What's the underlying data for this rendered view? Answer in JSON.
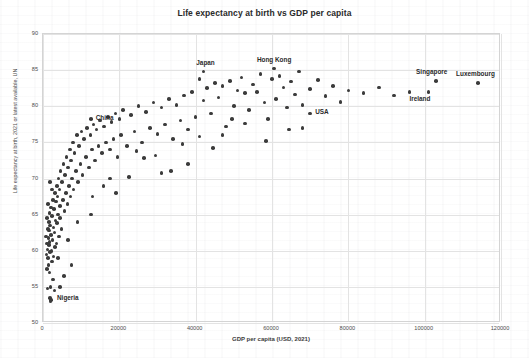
{
  "chart_data": {
    "type": "scatter",
    "title": "Life expectancy at birth vs GDP per capita",
    "xlabel": "GDP per capita  (USD, 2021)",
    "ylabel": "Life expectancy at birth, 2021 or latest available, UN",
    "xlim": [
      0,
      120000
    ],
    "ylim": [
      50,
      90
    ],
    "xticks": [
      "0",
      "20000",
      "40000",
      "60000",
      "80000",
      "100000",
      "120000"
    ],
    "xtick_values": [
      0,
      20000,
      40000,
      60000,
      80000,
      100000,
      120000
    ],
    "yticks": [
      "50",
      "55",
      "60",
      "65",
      "70",
      "75",
      "80",
      "85",
      "90"
    ],
    "ytick_values": [
      50,
      55,
      60,
      65,
      70,
      75,
      80,
      85,
      90
    ],
    "grid": true,
    "legend": "none",
    "marker_color": "#3b3b3b",
    "marker_size": 3.6,
    "points": [
      [
        800,
        62.0
      ],
      [
        900,
        59.5
      ],
      [
        1000,
        64.5
      ],
      [
        1000,
        61.0
      ],
      [
        1100,
        57.5
      ],
      [
        1150,
        60.2
      ],
      [
        1200,
        54.8
      ],
      [
        1250,
        63.0
      ],
      [
        1300,
        59.0
      ],
      [
        1350,
        66.5
      ],
      [
        1400,
        61.8
      ],
      [
        1450,
        58.0
      ],
      [
        1500,
        64.0
      ],
      [
        1550,
        60.8
      ],
      [
        1600,
        62.8
      ],
      [
        1650,
        57.0
      ],
      [
        1700,
        65.2
      ],
      [
        1750,
        61.2
      ],
      [
        1800,
        59.8
      ],
      [
        1850,
        63.5
      ],
      [
        1900,
        53.5
      ],
      [
        1950,
        55.0
      ],
      [
        2000,
        53.0
      ],
      [
        2050,
        62.2
      ],
      [
        2100,
        66.0
      ],
      [
        2200,
        60.0
      ],
      [
        2300,
        64.8
      ],
      [
        2400,
        58.5
      ],
      [
        2500,
        61.5
      ],
      [
        2600,
        67.0
      ],
      [
        2700,
        63.2
      ],
      [
        2800,
        59.2
      ],
      [
        2900,
        65.8
      ],
      [
        3000,
        62.5
      ],
      [
        3100,
        68.0
      ],
      [
        3200,
        60.5
      ],
      [
        3300,
        64.2
      ],
      [
        3400,
        66.8
      ],
      [
        3500,
        61.0
      ],
      [
        3600,
        69.0
      ],
      [
        3700,
        63.8
      ],
      [
        3800,
        67.5
      ],
      [
        3900,
        59.0
      ],
      [
        4000,
        65.0
      ],
      [
        4100,
        70.0
      ],
      [
        4200,
        62.0
      ],
      [
        4300,
        68.5
      ],
      [
        4400,
        64.5
      ],
      [
        4500,
        66.2
      ],
      [
        4600,
        71.0
      ],
      [
        4800,
        63.0
      ],
      [
        5000,
        69.5
      ],
      [
        5200,
        67.0
      ],
      [
        5400,
        72.0
      ],
      [
        5600,
        65.5
      ],
      [
        5800,
        70.5
      ],
      [
        6000,
        68.0
      ],
      [
        6200,
        73.0
      ],
      [
        6400,
        66.5
      ],
      [
        6600,
        71.5
      ],
      [
        6800,
        69.0
      ],
      [
        7000,
        74.0
      ],
      [
        7200,
        67.5
      ],
      [
        7400,
        72.5
      ],
      [
        7600,
        70.0
      ],
      [
        7800,
        75.0
      ],
      [
        8000,
        68.5
      ],
      [
        8300,
        73.5
      ],
      [
        8600,
        71.0
      ],
      [
        8900,
        76.0
      ],
      [
        9200,
        69.5
      ],
      [
        9500,
        74.5
      ],
      [
        9800,
        72.0
      ],
      [
        10100,
        76.5
      ],
      [
        10400,
        70.5
      ],
      [
        10800,
        75.5
      ],
      [
        11200,
        73.0
      ],
      [
        11600,
        77.0
      ],
      [
        12000,
        71.5
      ],
      [
        12400,
        76.0
      ],
      [
        12800,
        74.0
      ],
      [
        13200,
        77.5
      ],
      [
        13600,
        72.5
      ],
      [
        14000,
        76.8
      ],
      [
        14500,
        74.5
      ],
      [
        15000,
        78.0
      ],
      [
        15500,
        73.5
      ],
      [
        16000,
        77.2
      ],
      [
        16500,
        75.0
      ],
      [
        17000,
        78.5
      ],
      [
        17500,
        74.0
      ],
      [
        18000,
        77.8
      ],
      [
        18500,
        75.5
      ],
      [
        19000,
        79.0
      ],
      [
        19500,
        73.0
      ],
      [
        20000,
        78.2
      ],
      [
        20500,
        76.0
      ],
      [
        21000,
        79.5
      ],
      [
        22000,
        74.5
      ],
      [
        23000,
        78.8
      ],
      [
        24000,
        76.5
      ],
      [
        25000,
        80.0
      ],
      [
        26000,
        75.0
      ],
      [
        27000,
        79.2
      ],
      [
        28000,
        77.0
      ],
      [
        29000,
        80.5
      ],
      [
        30000,
        76.2
      ],
      [
        31000,
        79.8
      ],
      [
        32000,
        77.5
      ],
      [
        33000,
        81.0
      ],
      [
        34000,
        75.5
      ],
      [
        35000,
        80.2
      ],
      [
        36000,
        78.0
      ],
      [
        37000,
        81.5
      ],
      [
        38000,
        76.8
      ],
      [
        39000,
        82.0
      ],
      [
        40000,
        78.5
      ],
      [
        41000,
        83.8
      ],
      [
        42000,
        80.8
      ],
      [
        43000,
        82.5
      ],
      [
        44000,
        79.0
      ],
      [
        45000,
        83.2
      ],
      [
        46000,
        81.2
      ],
      [
        47000,
        82.8
      ],
      [
        48000,
        77.2
      ],
      [
        49000,
        83.5
      ],
      [
        50000,
        80.0
      ],
      [
        51000,
        82.2
      ],
      [
        52000,
        84.0
      ],
      [
        53000,
        81.8
      ],
      [
        54000,
        79.5
      ],
      [
        55000,
        83.0
      ],
      [
        56000,
        82.0
      ],
      [
        57000,
        84.5
      ],
      [
        58000,
        80.5
      ],
      [
        59000,
        78.2
      ],
      [
        60000,
        83.8
      ],
      [
        61000,
        81.0
      ],
      [
        62000,
        84.2
      ],
      [
        63000,
        82.6
      ],
      [
        64000,
        79.8
      ],
      [
        65000,
        83.4
      ],
      [
        66000,
        81.6
      ],
      [
        67000,
        84.8
      ],
      [
        68000,
        80.2
      ],
      [
        70000,
        82.4
      ],
      [
        72000,
        83.6
      ],
      [
        74000,
        81.4
      ],
      [
        76000,
        82.8
      ],
      [
        78000,
        80.6
      ],
      [
        80000,
        82.2
      ],
      [
        84000,
        81.8
      ],
      [
        88000,
        82.6
      ],
      [
        92000,
        81.5
      ],
      [
        96000,
        82.0
      ],
      [
        4500,
        55.0
      ],
      [
        3000,
        54.5
      ],
      [
        5500,
        56.5
      ],
      [
        2600,
        56.0
      ],
      [
        7500,
        58.0
      ],
      [
        12500,
        65.0
      ],
      [
        15800,
        69.0
      ],
      [
        22500,
        70.2
      ],
      [
        19200,
        68.0
      ],
      [
        26500,
        72.8
      ],
      [
        33500,
        71.0
      ],
      [
        29500,
        73.2
      ],
      [
        38000,
        72.0
      ],
      [
        44500,
        74.2
      ],
      [
        58500,
        75.2
      ],
      [
        64500,
        76.8
      ],
      [
        47000,
        76.0
      ],
      [
        36500,
        74.8
      ],
      [
        41000,
        75.8
      ],
      [
        31000,
        70.8
      ],
      [
        13000,
        67.5
      ],
      [
        9000,
        64.0
      ],
      [
        6500,
        61.5
      ],
      [
        17500,
        70.0
      ],
      [
        24500,
        73.8
      ],
      [
        53000,
        77.6
      ],
      [
        49500,
        78.2
      ],
      [
        68000,
        77.0
      ],
      [
        2400,
        68.5
      ],
      [
        1900,
        69.5
      ]
    ],
    "highlighted": [
      {
        "name": "China",
        "x": 12500,
        "y": 78.2,
        "label_dx": 5,
        "label_dy": -2.5
      },
      {
        "name": "Japan",
        "x": 42000,
        "y": 84.8,
        "label_dx": -7,
        "label_dy": -10
      },
      {
        "name": "Hong Kong",
        "x": 60500,
        "y": 85.2,
        "label_dx": -17,
        "label_dy": -10
      },
      {
        "name": "USA",
        "x": 70000,
        "y": 79.0,
        "label_dx": 5,
        "label_dy": -2.5
      },
      {
        "name": "Singapore",
        "x": 103000,
        "y": 83.5,
        "label_dx": -20,
        "label_dy": -10
      },
      {
        "name": "Luxembourg",
        "x": 114000,
        "y": 83.2,
        "label_dx": -22,
        "label_dy": -10
      },
      {
        "name": "Ireland",
        "x": 101000,
        "y": 82.0,
        "label_dx": -19,
        "label_dy": 6
      },
      {
        "name": "Nigeria",
        "x": 2100,
        "y": 53.2,
        "label_dx": 6,
        "label_dy": -2.5
      }
    ]
  }
}
